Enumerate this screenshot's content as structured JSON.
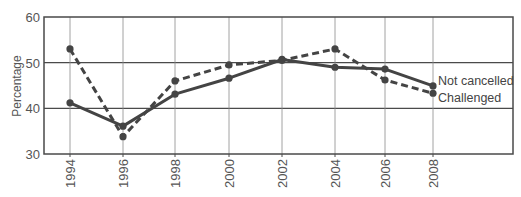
{
  "chart_data": {
    "type": "line",
    "title": "",
    "xlabel": "",
    "ylabel": "Percentage",
    "categories": [
      "1994",
      "1996",
      "1998",
      "2000",
      "2002",
      "2004",
      "2006",
      "2008"
    ],
    "ylim": [
      30,
      60
    ],
    "yticks": [
      "30",
      "40",
      "50",
      "60"
    ],
    "grid": true,
    "legend": "inline-right-end",
    "series": [
      {
        "name": "Not cancelled",
        "style": "solid",
        "color": "#444444",
        "values": [
          41.2,
          36.1,
          43.1,
          46.6,
          50.7,
          49.0,
          48.6,
          44.9
        ]
      },
      {
        "name": "Challenged",
        "style": "dashed",
        "color": "#444444",
        "values": [
          53.0,
          33.8,
          46.0,
          49.5,
          50.5,
          53.0,
          46.2,
          43.3
        ]
      }
    ]
  }
}
